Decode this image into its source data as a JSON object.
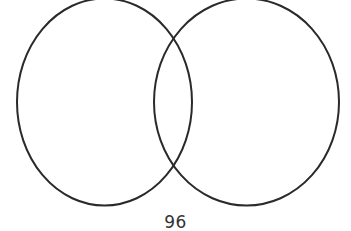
{
  "diagram": {
    "type": "venn",
    "sets": [
      {
        "name": "left-set",
        "label": ""
      },
      {
        "name": "right-set",
        "label": ""
      }
    ],
    "caption": "96",
    "stroke_color": "#2a2a2a",
    "background": "#ffffff"
  }
}
